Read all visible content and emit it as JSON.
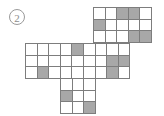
{
  "figure": {
    "index_label": "①",
    "index_text": "2",
    "type": "net-of-cube-puzzle",
    "colors": {
      "grid_line": "#7d7d7d",
      "cell_empty": "#ffffff",
      "cell_shaded": "#a8a8a8",
      "label_text": "#8d8d8d",
      "background": "#ffffff"
    },
    "cell_size_px": 11.6
  },
  "blocks": [
    {
      "name": "top-block",
      "cols": 5,
      "rows": 3,
      "x": 93,
      "y": 7,
      "cells": [
        [
          0,
          0,
          1,
          1,
          0
        ],
        [
          1,
          0,
          0,
          0,
          0
        ],
        [
          0,
          0,
          0,
          1,
          1
        ]
      ]
    },
    {
      "name": "middle-block",
      "cols": 9,
      "rows": 3,
      "x": 25,
      "y": 43,
      "cells": [
        [
          0,
          0,
          0,
          0,
          1,
          0,
          0,
          0,
          0
        ],
        [
          0,
          0,
          0,
          0,
          0,
          0,
          0,
          1,
          1
        ],
        [
          0,
          1,
          0,
          0,
          0,
          0,
          0,
          1,
          0
        ]
      ]
    },
    {
      "name": "bottom-block",
      "cols": 3,
      "rows": 3,
      "x": 60,
      "y": 78,
      "cells": [
        [
          0,
          0,
          0
        ],
        [
          1,
          0,
          0
        ],
        [
          0,
          0,
          1
        ]
      ]
    }
  ]
}
